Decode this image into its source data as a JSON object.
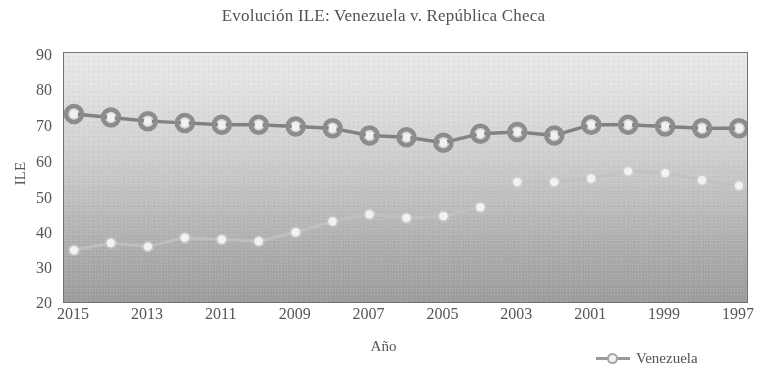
{
  "chart_data": {
    "type": "line",
    "title": "Evolución ILE: Venezuela v. República Checa",
    "xlabel": "Año",
    "ylabel": "ILE",
    "ylim": [
      20,
      90
    ],
    "ytick_step": 10,
    "yticks": [
      "90",
      "80",
      "70",
      "60",
      "50",
      "40",
      "30",
      "20"
    ],
    "xticks": [
      "2015",
      "2013",
      "2011",
      "2009",
      "2007",
      "2005",
      "2003",
      "2001",
      "1999",
      "1997"
    ],
    "x_axis_reversed": true,
    "x": [
      2015,
      2014,
      2013,
      2012,
      2011,
      2010,
      2009,
      2008,
      2007,
      2006,
      2005,
      2004,
      2003,
      2002,
      2001,
      2000,
      1999,
      1998,
      1997
    ],
    "grid": false,
    "legend_position": "bottom-right",
    "series": [
      {
        "name": "República Checa",
        "color": "#8a8a8a",
        "marker": "circle-outline-dark",
        "values": [
          73,
          72,
          71,
          70.5,
          70,
          70,
          69.5,
          69,
          67,
          66.5,
          65,
          67.5,
          68,
          67,
          70,
          70,
          69.5,
          69,
          69
        ]
      },
      {
        "name": "Venezuela",
        "color": "#cfcfcf",
        "marker": "circle-filled-light",
        "values": [
          35,
          37,
          36,
          38.5,
          38,
          37.5,
          40,
          43,
          45,
          44,
          44.5,
          47,
          54,
          54,
          55,
          57,
          56.5,
          54.5,
          53
        ]
      }
    ],
    "legend": [
      {
        "label": "Venezuela",
        "marker": "circle-filled-light"
      }
    ]
  }
}
